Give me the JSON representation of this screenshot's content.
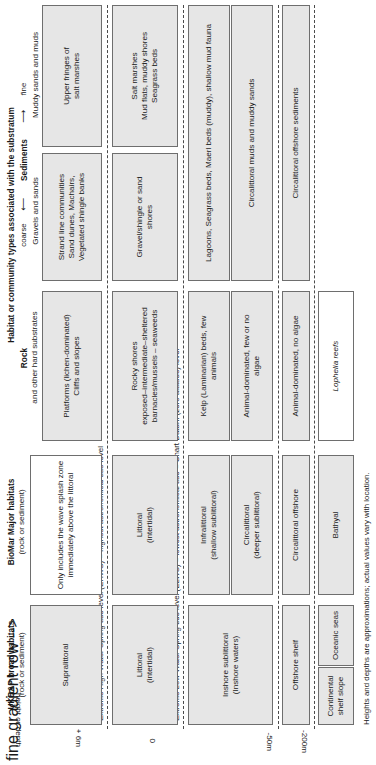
{
  "figure": {
    "axis_label": "height or depth",
    "footnote": "Heights and depths are approximations; actual values vary with location."
  },
  "columns": {
    "ukbap": {
      "title": "UKBAP broad habitats",
      "subtitle": "(rock or sediment)"
    },
    "biomar": {
      "title": "BioMar Major habitats",
      "subtitle": "(rock or sediment)"
    },
    "habitat": {
      "title": "Habitat or community types associated with the substratum",
      "rock": {
        "title": "Rock",
        "subtitle": "and other hard substrates"
      },
      "sediments": {
        "title": "Sediments",
        "gradient_left": "coarse",
        "gradient_right": "fine",
        "arrow_left": "⟵",
        "arrow_right": "⟶",
        "label_coarse": "Gravels and sands",
        "label_fine": "Muddy sands and muds"
      }
    }
  },
  "depth_labels": [
    {
      "id": "plus6m",
      "text": "+ 6m"
    },
    {
      "id": "zero",
      "text": "0"
    },
    {
      "id": "minus50m",
      "text": "-50m"
    },
    {
      "id": "minus200m",
      "text": "-200m"
    }
  ],
  "tide_lines": [
    {
      "id": "ehws",
      "text": "Extreme High Water Spring tide level (EHWS) = highest astronomical tide level"
    },
    {
      "id": "elws",
      "text": "Extreme Low Water Spring tide level (ELWS) = lowest astronomical tide = Chart Datum (zero altitude) level"
    },
    {
      "id": "shelf50",
      "text": ""
    },
    {
      "id": "shelf200",
      "text": ""
    }
  ],
  "zones": [
    {
      "id": "supralittoral",
      "ukbap": {
        "label": "Supralittoral",
        "fill": "grey"
      },
      "biomar": [
        {
          "label": "Only includes the wave splash zone immediately above the littoral",
          "fill": "white"
        }
      ],
      "rock": [
        {
          "label": "Platforms (lichen-dominated)\nCliffs and slopes",
          "fill": "grey"
        }
      ],
      "sediment": [
        {
          "label": "Strand line communities\nSand dunes, Machairs,\nVegetated shingle banks",
          "fill": "grey",
          "col": "coarse"
        },
        {
          "label": "Upper fringes of\nsalt marshes",
          "fill": "grey",
          "col": "fine"
        }
      ]
    },
    {
      "id": "littoral",
      "ukbap": {
        "label": "Littoral\n(intertidal)",
        "fill": "grey"
      },
      "biomar": [
        {
          "label": "Littoral\n(intertidal)",
          "fill": "grey"
        }
      ],
      "rock": [
        {
          "label": "Rocky shores\nexposed–intermediate–sheltered\nbarnacles/mussels – seaweeds",
          "fill": "grey"
        }
      ],
      "sediment": [
        {
          "label": "Gravel/shingle or sand\nshores",
          "fill": "grey",
          "col": "coarse"
        },
        {
          "label": "Salt marshes\nMud flats, muddy shores\nSeagrass beds",
          "fill": "grey",
          "col": "fine"
        }
      ]
    },
    {
      "id": "inshore-sublittoral",
      "ukbap": {
        "label": "Inshore sublittoral\n(Inshore waters)",
        "fill": "grey"
      },
      "biomar": [
        {
          "label": "Infralittoral\n(shallow sublittoral)",
          "fill": "grey"
        },
        {
          "label": "Circalittoral\n(deeper sublittoral)",
          "fill": "grey"
        }
      ],
      "rock": [
        {
          "label": "Kelp (Laminarian) beds, few\nanimals",
          "fill": "grey"
        },
        {
          "label": "Animal-dominated, few or no\nalgae",
          "fill": "grey"
        }
      ],
      "sediment": [
        {
          "label": "Maerl beds (clear), shallow\nsand/gravel fauna",
          "fill": "grey"
        },
        {
          "label": "Circalittoral gravels and\nsands",
          "fill": "grey"
        }
      ],
      "sediment_span": "Lagoons, Seagrass beds, Maerl beds (muddy), shallow mud fauna",
      "sediment_span2": "Circalittoral muds and muddy sands"
    },
    {
      "id": "offshore-shelf",
      "ukbap": {
        "label": "Offshore shelf",
        "fill": "grey"
      },
      "biomar": [
        {
          "label": "Circalittoral offshore",
          "fill": "grey"
        }
      ],
      "rock": [
        {
          "label": "Animal-dominated, no algae",
          "fill": "grey"
        }
      ],
      "sediment": [
        {
          "label": "Circalittoral offshore sediments",
          "fill": "grey"
        }
      ]
    },
    {
      "id": "deep",
      "ukbap_a": {
        "label": "Continental shelf slope",
        "fill": "grey"
      },
      "ukbap_b": {
        "label": "Oceanic seas",
        "fill": "grey"
      },
      "biomar": [
        {
          "label": "Bathyal",
          "fill": "grey"
        }
      ],
      "rock": [
        {
          "label": "Lophelia reefs",
          "fill": "white",
          "italic": true
        }
      ],
      "sediment": []
    }
  ]
}
